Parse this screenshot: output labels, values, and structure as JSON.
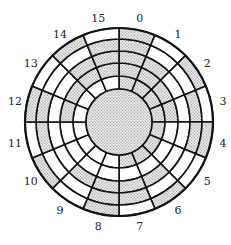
{
  "diagram": {
    "center": [
      119,
      122
    ],
    "inner_radius": 33,
    "ring_radii": [
      33,
      46,
      59,
      71,
      83,
      94
    ],
    "sector_count": 16,
    "sector_labels": [
      "0",
      "1",
      "2",
      "3",
      "4",
      "5",
      "6",
      "7",
      "8",
      "9",
      "10",
      "11",
      "12",
      "13",
      "14",
      "15"
    ],
    "label_radius": 106,
    "colors": {
      "stroke": "#111111",
      "shaded": "#cfcfcf",
      "white": "#ffffff"
    },
    "rings_inner_to_outer": [
      [
        1,
        1,
        1,
        1,
        1,
        1,
        1,
        1,
        0,
        0,
        0,
        0,
        0,
        0,
        0,
        0
      ],
      [
        1,
        1,
        1,
        1,
        0,
        0,
        0,
        0,
        0,
        0,
        0,
        0,
        1,
        1,
        1,
        1
      ],
      [
        1,
        1,
        0,
        0,
        0,
        0,
        1,
        1,
        1,
        1,
        0,
        0,
        0,
        0,
        1,
        1
      ],
      [
        1,
        0,
        0,
        1,
        1,
        0,
        0,
        1,
        1,
        0,
        0,
        1,
        1,
        0,
        0,
        1
      ],
      [
        1,
        0,
        1,
        0,
        1,
        0,
        1,
        0,
        1,
        0,
        1,
        0,
        1,
        0,
        1,
        0
      ]
    ],
    "center_disk_shaded": true
  }
}
